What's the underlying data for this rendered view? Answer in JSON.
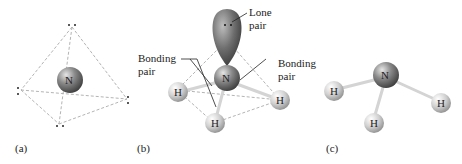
{
  "panels": {
    "a": {
      "caption": "(a)",
      "central_atom": "N"
    },
    "b": {
      "caption": "(b)",
      "central_atom": "N",
      "hydrogens": [
        "H",
        "H",
        "H"
      ],
      "labels": {
        "lone_pair_line1": "Lone",
        "lone_pair_line2": "pair",
        "bonding_left_line1": "Bonding",
        "bonding_left_line2": "pair",
        "bonding_right_line1": "Bonding",
        "bonding_right_line2": "pair"
      }
    },
    "c": {
      "caption": "(c)",
      "central_atom": "N",
      "hydrogens": [
        "H",
        "H",
        "H"
      ]
    }
  },
  "colors": {
    "nitrogen": "#6f6f6f",
    "hydrogen": "#c8c8c8",
    "dashed_edge": "#b0b0b0",
    "bond": "#d8d8d8"
  }
}
